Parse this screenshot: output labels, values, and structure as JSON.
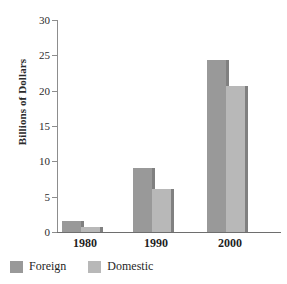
{
  "chart_data": {
    "type": "bar",
    "title": "",
    "xlabel": "",
    "ylabel": "Billions of Dollars",
    "categories": [
      "1980",
      "1990",
      "2000"
    ],
    "series": [
      {
        "name": "Foreign",
        "color": "#999999",
        "values": [
          1.5,
          9.0,
          24.3
        ]
      },
      {
        "name": "Domestic",
        "color": "#b8b8b8",
        "values": [
          0.7,
          6.1,
          20.6
        ]
      }
    ],
    "ylim": [
      0,
      30
    ],
    "yticks": [
      0,
      5,
      10,
      15,
      20,
      25,
      30
    ],
    "ytick_labels": [
      "0",
      "5",
      "10",
      "15",
      "20",
      "25",
      "30"
    ],
    "grid": false,
    "legend_position": "bottom-left"
  },
  "axes": {
    "y_title": "Billions of Dollars"
  },
  "legend": {
    "items": [
      {
        "label": "Foreign",
        "color": "#999999"
      },
      {
        "label": "Domestic",
        "color": "#b8b8b8"
      }
    ]
  }
}
